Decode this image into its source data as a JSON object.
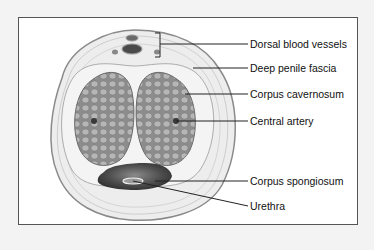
{
  "figure": {
    "type": "anatomical cross-section diagram",
    "labels": [
      {
        "id": "dorsal-blood-vessels",
        "text": "Dorsal blood vessels"
      },
      {
        "id": "deep-penile-fascia",
        "text": "Deep penile fascia"
      },
      {
        "id": "corpus-cavernosum",
        "text": "Corpus cavernosum"
      },
      {
        "id": "central-artery",
        "text": "Central artery"
      },
      {
        "id": "corpus-spongiosum",
        "text": "Corpus spongiosum"
      },
      {
        "id": "urethra",
        "text": "Urethra"
      }
    ]
  },
  "colors": {
    "outer_tissue": "#ececec",
    "outline": "#8a8a8a",
    "cavernosum_fill": "#8f8f8f",
    "cavernosum_cell": "#b4b4b4",
    "spongiosum_fill": "#4a4a4a",
    "leader_line": "#222222"
  }
}
